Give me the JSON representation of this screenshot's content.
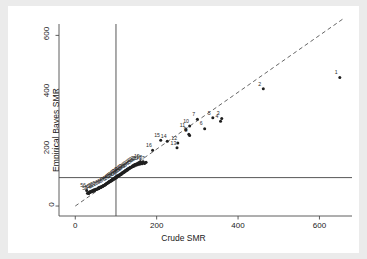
{
  "chart_data": {
    "type": "scatter",
    "title": "",
    "xlabel": "Crude SMR",
    "ylabel": "Empirical Bayes SMR",
    "xlim": [
      -40,
      680
    ],
    "ylim": [
      -35,
      640
    ],
    "xticks": [
      0,
      200,
      400,
      600
    ],
    "yticks": [
      0,
      200,
      400,
      600
    ],
    "grid": false,
    "legend": null,
    "reference_lines": [
      {
        "name": "identity-line",
        "type": "diagonal",
        "style": "dashed",
        "from": [
          0,
          0
        ],
        "to": [
          660,
          660
        ],
        "color": "#555555"
      },
      {
        "name": "vertical-null-line",
        "type": "vertical",
        "value": 100,
        "style": "solid",
        "color": "#444444"
      },
      {
        "name": "horizontal-null-line",
        "type": "horizontal",
        "value": 100,
        "style": "solid",
        "color": "#444444"
      }
    ],
    "points": [
      {
        "label": "1",
        "x": 650,
        "y": 452
      },
      {
        "label": "2",
        "x": 462,
        "y": 412
      },
      {
        "label": "3",
        "x": 360,
        "y": 308
      },
      {
        "label": "4",
        "x": 357,
        "y": 298
      },
      {
        "label": "5",
        "x": 338,
        "y": 310
      },
      {
        "label": "6",
        "x": 318,
        "y": 272
      },
      {
        "label": "7",
        "x": 300,
        "y": 305
      },
      {
        "label": "8",
        "x": 281,
        "y": 248
      },
      {
        "label": "9",
        "x": 279,
        "y": 252
      },
      {
        "label": "10",
        "x": 281,
        "y": 281
      },
      {
        "label": "11",
        "x": 272,
        "y": 268
      },
      {
        "label": "12",
        "x": 252,
        "y": 222
      },
      {
        "label": "13",
        "x": 250,
        "y": 205
      },
      {
        "label": "14",
        "x": 226,
        "y": 228
      },
      {
        "label": "15",
        "x": 210,
        "y": 231
      },
      {
        "label": "16",
        "x": 190,
        "y": 196
      },
      {
        "label": "17",
        "x": 172,
        "y": 152
      },
      {
        "label": "18",
        "x": 166,
        "y": 155
      },
      {
        "label": "19",
        "x": 160,
        "y": 156
      },
      {
        "label": "20",
        "x": 156,
        "y": 152
      },
      {
        "label": "21",
        "x": 152,
        "y": 150
      },
      {
        "label": "22",
        "x": 148,
        "y": 147
      },
      {
        "label": "23",
        "x": 144,
        "y": 144
      },
      {
        "label": "24",
        "x": 141,
        "y": 140
      },
      {
        "label": "25",
        "x": 138,
        "y": 137
      },
      {
        "label": "26",
        "x": 134,
        "y": 134
      },
      {
        "label": "27",
        "x": 131,
        "y": 130
      },
      {
        "label": "28",
        "x": 128,
        "y": 127
      },
      {
        "label": "29",
        "x": 125,
        "y": 124
      },
      {
        "label": "30",
        "x": 122,
        "y": 121
      },
      {
        "label": "31",
        "x": 119,
        "y": 119
      },
      {
        "label": "32",
        "x": 117,
        "y": 116
      },
      {
        "label": "33",
        "x": 114,
        "y": 113
      },
      {
        "label": "34",
        "x": 112,
        "y": 111
      },
      {
        "label": "35",
        "x": 110,
        "y": 109
      },
      {
        "label": "36",
        "x": 107,
        "y": 106
      },
      {
        "label": "37",
        "x": 105,
        "y": 104
      },
      {
        "label": "38",
        "x": 102,
        "y": 101
      },
      {
        "label": "39",
        "x": 100,
        "y": 99
      },
      {
        "label": "40",
        "x": 97,
        "y": 96
      },
      {
        "label": "41",
        "x": 94,
        "y": 93
      },
      {
        "label": "42",
        "x": 91,
        "y": 91
      },
      {
        "label": "43",
        "x": 88,
        "y": 88
      },
      {
        "label": "44",
        "x": 85,
        "y": 85
      },
      {
        "label": "45",
        "x": 81,
        "y": 82
      },
      {
        "label": "46",
        "x": 77,
        "y": 78
      },
      {
        "label": "47",
        "x": 73,
        "y": 74
      },
      {
        "label": "48",
        "x": 68,
        "y": 70
      },
      {
        "label": "49",
        "x": 63,
        "y": 66
      },
      {
        "label": "50",
        "x": 58,
        "y": 62
      },
      {
        "label": "51",
        "x": 53,
        "y": 59
      },
      {
        "label": "52",
        "x": 48,
        "y": 55
      },
      {
        "label": "53",
        "x": 44,
        "y": 52
      },
      {
        "label": "54",
        "x": 40,
        "y": 50
      },
      {
        "label": "55",
        "x": 33,
        "y": 44
      },
      {
        "label": "56",
        "x": 28,
        "y": 55
      }
    ],
    "cluster_points": [
      {
        "x": 170,
        "y": 150
      },
      {
        "x": 164,
        "y": 149
      },
      {
        "x": 158,
        "y": 147
      },
      {
        "x": 153,
        "y": 145
      },
      {
        "x": 149,
        "y": 143
      },
      {
        "x": 145,
        "y": 141
      },
      {
        "x": 142,
        "y": 139
      },
      {
        "x": 139,
        "y": 137
      },
      {
        "x": 136,
        "y": 135
      },
      {
        "x": 133,
        "y": 132
      },
      {
        "x": 130,
        "y": 130
      },
      {
        "x": 128,
        "y": 128
      },
      {
        "x": 126,
        "y": 126
      },
      {
        "x": 124,
        "y": 124
      },
      {
        "x": 122,
        "y": 122
      },
      {
        "x": 120,
        "y": 120
      },
      {
        "x": 118,
        "y": 118
      },
      {
        "x": 116,
        "y": 116
      },
      {
        "x": 114,
        "y": 114
      },
      {
        "x": 112,
        "y": 112
      },
      {
        "x": 110,
        "y": 110
      },
      {
        "x": 108,
        "y": 108
      },
      {
        "x": 106,
        "y": 107
      },
      {
        "x": 104,
        "y": 105
      },
      {
        "x": 102,
        "y": 103
      },
      {
        "x": 100,
        "y": 101
      },
      {
        "x": 98,
        "y": 99
      },
      {
        "x": 96,
        "y": 97
      },
      {
        "x": 94,
        "y": 95
      },
      {
        "x": 92,
        "y": 93
      },
      {
        "x": 90,
        "y": 91
      },
      {
        "x": 88,
        "y": 89
      },
      {
        "x": 86,
        "y": 87
      },
      {
        "x": 84,
        "y": 85
      },
      {
        "x": 82,
        "y": 84
      },
      {
        "x": 80,
        "y": 82
      },
      {
        "x": 78,
        "y": 80
      },
      {
        "x": 76,
        "y": 78
      },
      {
        "x": 74,
        "y": 76
      },
      {
        "x": 72,
        "y": 74
      },
      {
        "x": 70,
        "y": 72
      },
      {
        "x": 68,
        "y": 71
      },
      {
        "x": 66,
        "y": 69
      },
      {
        "x": 64,
        "y": 67
      },
      {
        "x": 62,
        "y": 65
      },
      {
        "x": 60,
        "y": 64
      },
      {
        "x": 57,
        "y": 62
      },
      {
        "x": 54,
        "y": 60
      },
      {
        "x": 51,
        "y": 58
      },
      {
        "x": 48,
        "y": 56
      },
      {
        "x": 45,
        "y": 54
      },
      {
        "x": 42,
        "y": 52
      },
      {
        "x": 39,
        "y": 50
      },
      {
        "x": 36,
        "y": 48
      },
      {
        "x": 33,
        "y": 46
      },
      {
        "x": 30,
        "y": 45
      },
      {
        "x": 46,
        "y": 57
      },
      {
        "x": 43,
        "y": 55
      },
      {
        "x": 40,
        "y": 53
      },
      {
        "x": 37,
        "y": 51
      },
      {
        "x": 35,
        "y": 49
      },
      {
        "x": 32,
        "y": 47
      },
      {
        "x": 50,
        "y": 59
      },
      {
        "x": 56,
        "y": 63
      },
      {
        "x": 59,
        "y": 66
      },
      {
        "x": 63,
        "y": 68
      },
      {
        "x": 67,
        "y": 70
      },
      {
        "x": 71,
        "y": 73
      },
      {
        "x": 75,
        "y": 77
      },
      {
        "x": 79,
        "y": 81
      },
      {
        "x": 83,
        "y": 86
      },
      {
        "x": 87,
        "y": 90
      },
      {
        "x": 91,
        "y": 94
      },
      {
        "x": 95,
        "y": 98
      },
      {
        "x": 99,
        "y": 102
      },
      {
        "x": 103,
        "y": 106
      },
      {
        "x": 107,
        "y": 109
      },
      {
        "x": 111,
        "y": 113
      },
      {
        "x": 115,
        "y": 117
      },
      {
        "x": 119,
        "y": 121
      },
      {
        "x": 123,
        "y": 125
      },
      {
        "x": 127,
        "y": 129
      },
      {
        "x": 131,
        "y": 133
      },
      {
        "x": 135,
        "y": 136
      },
      {
        "x": 141,
        "y": 142
      },
      {
        "x": 147,
        "y": 146
      },
      {
        "x": 155,
        "y": 151
      },
      {
        "x": 161,
        "y": 153
      },
      {
        "x": 167,
        "y": 156
      },
      {
        "x": 174,
        "y": 154
      }
    ]
  },
  "colors": {
    "figure_background": "#ebebeb",
    "panel_background": "#ffffff",
    "axis": "#4d4d4d",
    "point": "#1f1f1f",
    "reference_line": "#444444",
    "identity_line": "#555555",
    "text": "#1a1a1a"
  }
}
